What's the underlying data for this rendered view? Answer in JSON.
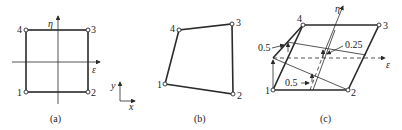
{
  "figure": {
    "panel_a": {
      "caption": "(a)",
      "nodes": [
        {
          "id": "1",
          "x": 26,
          "y": 92
        },
        {
          "id": "2",
          "x": 88,
          "y": 92
        },
        {
          "id": "3",
          "x": 88,
          "y": 30
        },
        {
          "id": "4",
          "x": 26,
          "y": 30
        }
      ],
      "axis_eta": "η",
      "axis_eps": "ε"
    },
    "global_axes": {
      "x_label": "x",
      "y_label": "y"
    },
    "panel_b": {
      "caption": "(b)",
      "nodes": [
        {
          "id": "1",
          "x": 165,
          "y": 84
        },
        {
          "id": "2",
          "x": 233,
          "y": 94
        },
        {
          "id": "3",
          "x": 232,
          "y": 24
        },
        {
          "id": "4",
          "x": 179,
          "y": 30
        }
      ]
    },
    "panel_c": {
      "caption": "(c)",
      "nodes": [
        {
          "id": "1",
          "x": 273,
          "y": 90
        },
        {
          "id": "2",
          "x": 348,
          "y": 90
        },
        {
          "id": "3",
          "x": 379,
          "y": 25
        },
        {
          "id": "4",
          "x": 303,
          "y": 25
        }
      ],
      "axis_eta": "η",
      "axis_eps": "ε",
      "annotations": [
        "0.5",
        "0.25",
        "0.5"
      ]
    }
  }
}
